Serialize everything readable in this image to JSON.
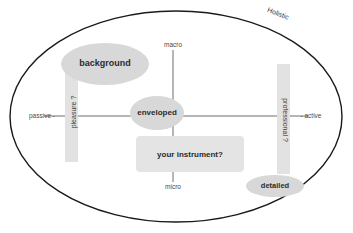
{
  "diagram": {
    "title": "Holistic",
    "boundary": {
      "shape": "ellipse",
      "stroke": "#1a1a1a"
    },
    "palette": {
      "blob_fill": "#d8d8d8",
      "bar_fill": "#e2e2e2",
      "rect_fill": "#e4e4e4",
      "axis_stroke": "#6f6f6f",
      "boundary_stroke": "#1a1a1a",
      "label_text": "#2b2b2b",
      "background": "#ffffff"
    },
    "axes": {
      "vertical": {
        "top_label": "macro",
        "bottom_label": "micro"
      },
      "horizontal": {
        "left_label": "passive -",
        "right_label": "- active"
      }
    },
    "bars": [
      {
        "label": "pleasure ?",
        "side": "left",
        "orientation": "rotated-up"
      },
      {
        "label": "professional ?",
        "side": "right",
        "orientation": "rotated-down"
      }
    ],
    "blobs": [
      {
        "label": "background",
        "shape": "ellipse",
        "quadrant": "upper-left"
      },
      {
        "label": "enveloped",
        "shape": "ellipse",
        "quadrant": "center"
      },
      {
        "label": "your instrument?",
        "shape": "rounded-rect",
        "quadrant": "lower-center"
      },
      {
        "label": "detailed",
        "shape": "ellipse",
        "quadrant": "lower-right"
      }
    ]
  }
}
